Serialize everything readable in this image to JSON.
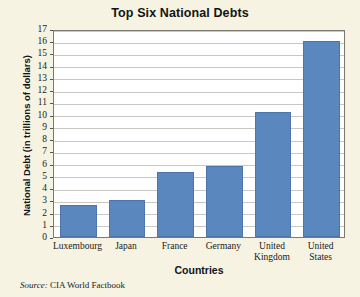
{
  "figure": {
    "title": "Top Six National Debts",
    "source_lead": "Source:",
    "source_text": "CIA World Factbook",
    "background_color": "#f6f3e2",
    "plot_background_color": "#ffffff",
    "bar_color": "#5b87bf",
    "grid_color": "#c8c8c2"
  },
  "chart_data": {
    "type": "bar",
    "title": "Top Six National Debts",
    "xlabel": "Countries",
    "ylabel": "National Debt (in trillions of dollars)",
    "categories": [
      "Luxembourg",
      "Japan",
      "France",
      "Germany",
      "United Kingdom",
      "United States"
    ],
    "values": [
      2.6,
      3.0,
      5.3,
      5.8,
      10.2,
      16.0
    ],
    "ylim": [
      0,
      17
    ],
    "ytick_step": 1,
    "yticks": [
      0,
      1,
      2,
      3,
      4,
      5,
      6,
      7,
      8,
      9,
      10,
      11,
      12,
      13,
      14,
      15,
      16,
      17
    ],
    "ytick_labels": [
      "0",
      "1",
      "2",
      "3",
      "4",
      "5",
      "6",
      "7",
      "8",
      "9",
      "10",
      "11",
      "12",
      "13",
      "14",
      "15",
      "16",
      "17"
    ],
    "grid": true,
    "grid_axis": "y",
    "legend": false,
    "legend_position": "none",
    "series": [
      {
        "name": "National Debt",
        "color": "#5b87bf",
        "values": [
          2.6,
          3.0,
          5.3,
          5.8,
          10.2,
          16.0
        ]
      }
    ],
    "annotations": [
      "Source: CIA World Factbook"
    ]
  }
}
